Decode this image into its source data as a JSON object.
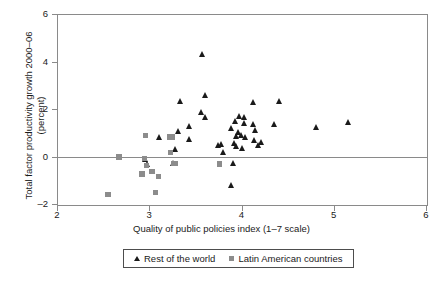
{
  "chart_data": {
    "type": "scatter",
    "title": "",
    "xlabel": "Quality of public policies index (1–7 scale)",
    "ylabel": "Total factor productivity growth 2000–06\n(percent)",
    "xlim": [
      2,
      6
    ],
    "ylim": [
      -2,
      6
    ],
    "xticks": [
      2,
      3,
      4,
      5,
      6
    ],
    "yticks": [
      -2,
      0,
      2,
      4,
      6
    ],
    "grid": false,
    "zero_line": true,
    "legend_position": "below",
    "series": [
      {
        "name": "Rest of the world",
        "marker": "triangle",
        "color": "#1a1a1a",
        "points": [
          [
            3.57,
            4.35
          ],
          [
            3.6,
            2.6
          ],
          [
            3.33,
            2.37
          ],
          [
            4.12,
            2.33
          ],
          [
            4.4,
            2.35
          ],
          [
            3.56,
            1.9
          ],
          [
            3.6,
            1.67
          ],
          [
            3.97,
            1.72
          ],
          [
            4.02,
            1.68
          ],
          [
            3.92,
            1.52
          ],
          [
            4.02,
            1.44
          ],
          [
            4.12,
            1.38
          ],
          [
            4.35,
            1.4
          ],
          [
            5.15,
            1.48
          ],
          [
            4.8,
            1.26
          ],
          [
            4.14,
            1.16
          ],
          [
            3.43,
            1.3
          ],
          [
            3.31,
            1.11
          ],
          [
            3.88,
            1.22
          ],
          [
            3.96,
            1.05
          ],
          [
            3.99,
            0.92
          ],
          [
            4.03,
            0.84
          ],
          [
            3.94,
            0.88
          ],
          [
            3.22,
            0.85
          ],
          [
            3.1,
            0.83
          ],
          [
            3.43,
            0.77
          ],
          [
            4.13,
            0.72
          ],
          [
            4.21,
            0.62
          ],
          [
            4.17,
            0.52
          ],
          [
            3.77,
            0.56
          ],
          [
            3.74,
            0.5
          ],
          [
            3.91,
            0.58
          ],
          [
            3.94,
            0.45
          ],
          [
            4.0,
            0.38
          ],
          [
            3.79,
            0.2
          ],
          [
            3.28,
            0.33
          ],
          [
            2.95,
            -0.08
          ],
          [
            2.97,
            -0.3
          ],
          [
            3.25,
            -0.25
          ],
          [
            3.9,
            -0.23
          ],
          [
            3.88,
            -1.18
          ]
        ]
      },
      {
        "name": "Latin American countries",
        "marker": "square",
        "color": "#8c8c8c",
        "points": [
          [
            2.66,
            0.02
          ],
          [
            2.95,
            0.92
          ],
          [
            3.21,
            0.86
          ],
          [
            3.24,
            0.86
          ],
          [
            3.22,
            0.22
          ],
          [
            2.94,
            -0.05
          ],
          [
            2.96,
            -0.33
          ],
          [
            2.91,
            -0.7
          ],
          [
            3.02,
            -0.6
          ],
          [
            3.09,
            -0.8
          ],
          [
            3.25,
            -0.25
          ],
          [
            3.27,
            -0.26
          ],
          [
            3.75,
            -0.27
          ],
          [
            2.54,
            -1.55
          ],
          [
            3.06,
            -1.48
          ]
        ]
      }
    ]
  },
  "legend": {
    "items": [
      {
        "label": "Rest of the world",
        "marker": "triangle"
      },
      {
        "label": "Latin American countries",
        "marker": "square"
      }
    ]
  }
}
